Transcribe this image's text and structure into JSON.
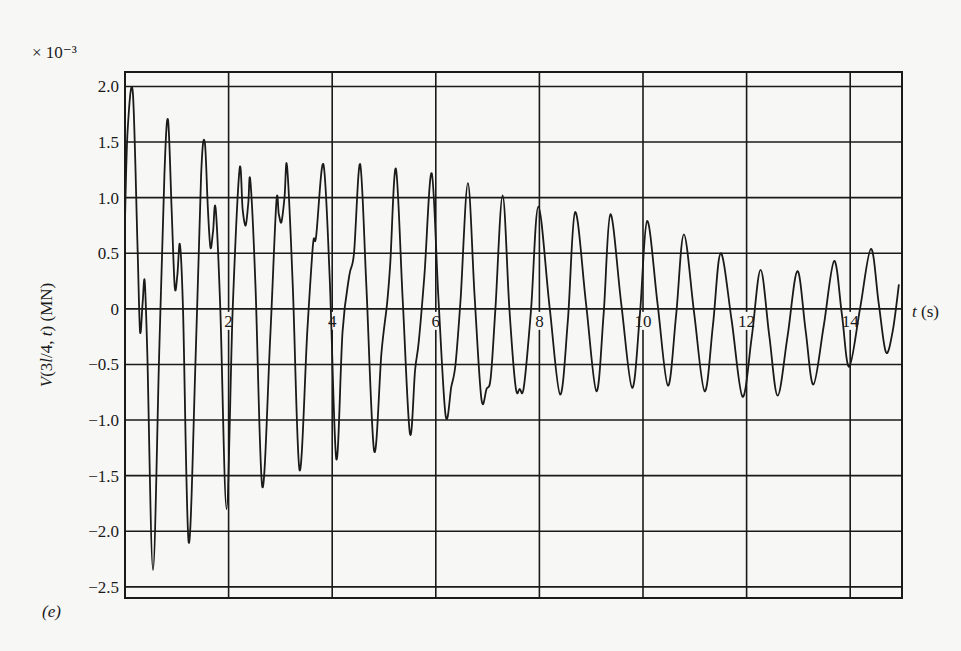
{
  "chart_data": {
    "type": "line",
    "title": "",
    "panel_label": "(e)",
    "xlabel": "t (s)",
    "xlabel_italic_part": "t",
    "xlabel_unit_part": " (s)",
    "ylabel": "V(3l/4, t) (MN)",
    "y_scale_note": "× 10⁻³",
    "xlim": [
      0,
      15
    ],
    "ylim": [
      -2.6,
      2.13
    ],
    "grid": true,
    "x_ticks": [
      2,
      4,
      6,
      8,
      10,
      12,
      14
    ],
    "x_tick_labels": [
      "2",
      "4",
      "6",
      "8",
      "10",
      "12",
      "14"
    ],
    "y_ticks": [
      2.0,
      1.5,
      1.0,
      0.5,
      0,
      -0.5,
      -1.0,
      -1.5,
      -2.0,
      -2.5
    ],
    "y_tick_labels": [
      "2.0",
      "1.5",
      "1.0",
      "0.5",
      "0",
      "−0.5",
      "−1.0",
      "−1.5",
      "−2.0",
      "−2.5"
    ],
    "series": [
      {
        "name": "V(3l/4, t)",
        "x": [
          0,
          0.05,
          0.15,
          0.24,
          0.29,
          0.34,
          0.38,
          0.43,
          0.54,
          0.66,
          0.76,
          0.83,
          0.9,
          0.96,
          1.01,
          1.06,
          1.12,
          1.23,
          1.36,
          1.47,
          1.54,
          1.6,
          1.65,
          1.7,
          1.75,
          1.84,
          1.96,
          2.08,
          2.21,
          2.27,
          2.33,
          2.38,
          2.42,
          2.52,
          2.65,
          2.8,
          2.92,
          2.97,
          3.02,
          3.08,
          3.13,
          3.24,
          3.37,
          3.52,
          3.63,
          3.69,
          3.83,
          3.95,
          4.08,
          4.2,
          4.33,
          4.42,
          4.54,
          4.66,
          4.81,
          4.95,
          5.06,
          5.12,
          5.23,
          5.36,
          5.5,
          5.6,
          5.67,
          5.78,
          5.92,
          6.05,
          6.19,
          6.3,
          6.38,
          6.48,
          6.62,
          6.75,
          6.88,
          6.98,
          7.06,
          7.15,
          7.29,
          7.42,
          7.54,
          7.62,
          7.7,
          7.84,
          7.98,
          8.2,
          8.4,
          8.55,
          8.69,
          8.9,
          9.1,
          9.24,
          9.37,
          9.58,
          9.79,
          9.94,
          10.08,
          10.28,
          10.48,
          10.64,
          10.79,
          10.99,
          11.19,
          11.35,
          11.5,
          11.71,
          11.92,
          12.1,
          12.27,
          12.44,
          12.6,
          12.79,
          12.98,
          13.14,
          13.29,
          13.49,
          13.69,
          13.84,
          13.98,
          14.19,
          14.4,
          14.55,
          14.69,
          14.82,
          14.94
        ],
        "y": [
          0.8,
          1.6,
          1.95,
          0.6,
          -0.2,
          0.05,
          0.25,
          -0.4,
          -2.35,
          -0.4,
          1.2,
          1.7,
          0.9,
          0.2,
          0.3,
          0.58,
          0.0,
          -2.1,
          -0.5,
          1.2,
          1.5,
          0.9,
          0.55,
          0.7,
          0.9,
          0.0,
          -1.8,
          0.0,
          1.25,
          0.9,
          0.75,
          0.95,
          1.15,
          0.2,
          -1.6,
          -0.3,
          0.95,
          0.85,
          0.78,
          1.0,
          1.28,
          0.2,
          -1.45,
          -0.2,
          0.58,
          0.65,
          1.3,
          0.3,
          -1.35,
          -0.2,
          0.3,
          0.5,
          1.3,
          0.2,
          -1.28,
          -0.4,
          0.05,
          0.4,
          1.26,
          0.1,
          -1.12,
          -0.55,
          -0.3,
          0.3,
          1.22,
          0.1,
          -0.96,
          -0.7,
          -0.5,
          0.1,
          1.13,
          0.1,
          -0.81,
          -0.72,
          -0.62,
          0.0,
          1.02,
          0.0,
          -0.7,
          -0.72,
          -0.7,
          0.0,
          0.92,
          0.0,
          -0.77,
          -0.1,
          0.87,
          0.05,
          -0.74,
          -0.05,
          0.85,
          0.05,
          -0.71,
          -0.05,
          0.79,
          0.05,
          -0.69,
          -0.05,
          0.67,
          -0.05,
          -0.74,
          -0.15,
          0.5,
          -0.1,
          -0.79,
          -0.25,
          0.35,
          -0.25,
          -0.78,
          -0.25,
          0.34,
          -0.2,
          -0.68,
          -0.15,
          0.43,
          -0.05,
          -0.52,
          0.0,
          0.54,
          0.05,
          -0.39,
          -0.2,
          0.22
        ]
      }
    ]
  }
}
